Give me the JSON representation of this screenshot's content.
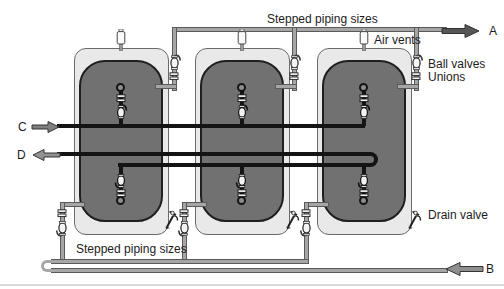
{
  "diagram": {
    "labels": {
      "stepped_piping_top": "Stepped piping sizes",
      "stepped_piping_bottom": "Stepped piping sizes",
      "air_vents": "Air vents",
      "ball_valves": "Ball valves",
      "unions": "Unions",
      "drain_valve": "Drain valve"
    },
    "ports": {
      "a": "A",
      "b": "B",
      "c": "C",
      "d": "D"
    },
    "colors": {
      "tank_outer": "#e9e9e9",
      "tank_inner": "#717171",
      "gray_pipe": "#a6a6a6",
      "black_pipe": "#141414",
      "arrow_a": "#565656",
      "arrow_b": "#8f8f8f",
      "arrow_c": "#7f7f7f",
      "arrow_d": "#929292"
    }
  }
}
